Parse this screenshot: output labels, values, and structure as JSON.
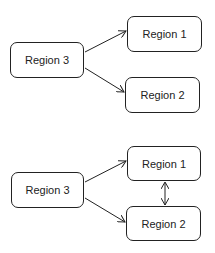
{
  "diagrams": [
    {
      "name": "one-way",
      "nodes": [
        {
          "id": "r3",
          "label": "Region 3",
          "x": 10,
          "y": 42,
          "w": 74,
          "h": 36
        },
        {
          "id": "r1",
          "label": "Region 1",
          "x": 127,
          "y": 16,
          "w": 75,
          "h": 36
        },
        {
          "id": "r2",
          "label": "Region 2",
          "x": 125,
          "y": 77,
          "w": 75,
          "h": 36
        }
      ],
      "edges": [
        {
          "from": "r3",
          "to": "r1",
          "type": "arrow"
        },
        {
          "from": "r3",
          "to": "r2",
          "type": "arrow"
        }
      ]
    },
    {
      "name": "with-link",
      "nodes": [
        {
          "id": "r3",
          "label": "Region 3",
          "x": 11,
          "y": 172,
          "w": 73,
          "h": 36
        },
        {
          "id": "r1",
          "label": "Region 1",
          "x": 127,
          "y": 146,
          "w": 74,
          "h": 35
        },
        {
          "id": "r2",
          "label": "Region 2",
          "x": 126,
          "y": 206,
          "w": 75,
          "h": 35
        }
      ],
      "edges": [
        {
          "from": "r3",
          "to": "r1",
          "type": "arrow"
        },
        {
          "from": "r3",
          "to": "r2",
          "type": "arrow"
        },
        {
          "from": "r1",
          "to": "r2",
          "type": "double-arrow"
        }
      ]
    }
  ],
  "colors": {
    "stroke": "#222222",
    "background": "#ffffff"
  }
}
